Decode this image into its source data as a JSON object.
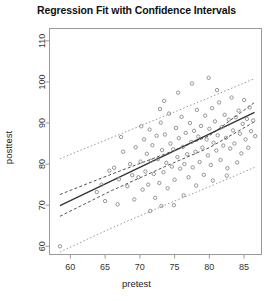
{
  "chart_data": {
    "type": "scatter",
    "title": "Regression Fit with Confidence Intervals",
    "xlabel": "pretest",
    "ylabel": "posttest",
    "xlim": [
      57.0,
      87.5
    ],
    "ylim": [
      58.0,
      113.0
    ],
    "xticks": [
      60,
      65,
      70,
      75,
      80,
      85
    ],
    "yticks": [
      60,
      70,
      80,
      90,
      100,
      110
    ],
    "grid": false,
    "legend": "none",
    "point_marker": "open-circle",
    "point_color": "#8a8a8a",
    "fit_line_color": "#333333",
    "ci_band_color": "#555555",
    "ci_band_style": "dashed",
    "pi_band_color": "#999999",
    "pi_band_style": "dotted",
    "fit_line": {
      "x": [
        58.5,
        86.5
      ],
      "y": [
        69.9,
        92.6
      ],
      "slope": 0.81,
      "intercept": 22.5
    },
    "confidence_band_upper": {
      "x": [
        58.5,
        66.0,
        74.0,
        80.0,
        86.5
      ],
      "y": [
        72.6,
        77.6,
        82.7,
        86.9,
        95.0
      ]
    },
    "confidence_band_lower": {
      "x": [
        58.5,
        66.0,
        74.0,
        80.0,
        86.5
      ],
      "y": [
        67.3,
        73.6,
        79.7,
        84.0,
        90.3
      ]
    },
    "prediction_band_upper": {
      "x": [
        58.5,
        66.0,
        74.0,
        80.0,
        86.5
      ],
      "y": [
        81.3,
        86.5,
        92.0,
        96.2,
        100.8
      ]
    },
    "prediction_band_lower": {
      "x": [
        58.5,
        66.0,
        74.0,
        80.0,
        86.5
      ],
      "y": [
        58.6,
        64.5,
        70.3,
        74.5,
        79.2
      ]
    },
    "points": [
      [
        58.5,
        60.0
      ],
      [
        66.3,
        79.1
      ],
      [
        67.0,
        76.3
      ],
      [
        67.6,
        83.0
      ],
      [
        68.2,
        74.6
      ],
      [
        68.6,
        80.0
      ],
      [
        68.9,
        77.3
      ],
      [
        69.2,
        71.4
      ],
      [
        69.4,
        84.1
      ],
      [
        69.8,
        76.8
      ],
      [
        70.1,
        80.6
      ],
      [
        70.4,
        73.8
      ],
      [
        70.6,
        86.0
      ],
      [
        70.8,
        78.2
      ],
      [
        71.0,
        82.5
      ],
      [
        71.2,
        75.0
      ],
      [
        71.4,
        88.4
      ],
      [
        71.6,
        80.8
      ],
      [
        71.8,
        84.6
      ],
      [
        72.0,
        77.6
      ],
      [
        72.2,
        71.8
      ],
      [
        72.4,
        86.9
      ],
      [
        72.6,
        81.2
      ],
      [
        72.8,
        75.4
      ],
      [
        73.0,
        90.1
      ],
      [
        73.2,
        83.4
      ],
      [
        73.4,
        78.0
      ],
      [
        73.6,
        87.2
      ],
      [
        73.8,
        80.3
      ],
      [
        74.0,
        74.1
      ],
      [
        74.2,
        92.3
      ],
      [
        74.4,
        85.0
      ],
      [
        74.6,
        79.4
      ],
      [
        74.8,
        83.6
      ],
      [
        75.0,
        76.2
      ],
      [
        75.2,
        88.8
      ],
      [
        75.4,
        81.7
      ],
      [
        75.6,
        86.3
      ],
      [
        75.8,
        78.9
      ],
      [
        76.0,
        91.5
      ],
      [
        76.2,
        84.2
      ],
      [
        76.4,
        80.0
      ],
      [
        76.6,
        87.6
      ],
      [
        76.8,
        82.4
      ],
      [
        77.0,
        76.8
      ],
      [
        77.2,
        90.0
      ],
      [
        77.4,
        85.4
      ],
      [
        77.6,
        79.2
      ],
      [
        77.8,
        88.1
      ],
      [
        78.0,
        83.0
      ],
      [
        78.2,
        93.2
      ],
      [
        78.4,
        86.7
      ],
      [
        78.6,
        80.5
      ],
      [
        78.8,
        89.3
      ],
      [
        79.0,
        84.0
      ],
      [
        79.2,
        77.4
      ],
      [
        79.4,
        91.8
      ],
      [
        79.6,
        86.0
      ],
      [
        79.8,
        82.1
      ],
      [
        80.0,
        88.6
      ],
      [
        80.2,
        79.8
      ],
      [
        80.4,
        93.6
      ],
      [
        80.6,
        85.2
      ],
      [
        80.8,
        90.4
      ],
      [
        81.0,
        83.3
      ],
      [
        81.2,
        87.0
      ],
      [
        81.4,
        95.0
      ],
      [
        81.6,
        81.0
      ],
      [
        81.8,
        89.0
      ],
      [
        82.0,
        84.5
      ],
      [
        82.2,
        92.0
      ],
      [
        82.4,
        86.4
      ],
      [
        82.6,
        79.0
      ],
      [
        82.8,
        90.8
      ],
      [
        83.0,
        83.8
      ],
      [
        83.2,
        96.2
      ],
      [
        83.4,
        88.2
      ],
      [
        83.6,
        85.0
      ],
      [
        83.8,
        91.4
      ],
      [
        84.0,
        80.4
      ],
      [
        84.2,
        93.0
      ],
      [
        84.4,
        87.4
      ],
      [
        84.6,
        82.6
      ],
      [
        84.8,
        89.8
      ],
      [
        85.0,
        95.6
      ],
      [
        85.2,
        86.0
      ],
      [
        85.4,
        91.0
      ],
      [
        85.6,
        84.0
      ],
      [
        85.8,
        93.8
      ],
      [
        86.0,
        88.0
      ],
      [
        86.3,
        90.6
      ],
      [
        86.6,
        86.8
      ],
      [
        64.5,
        75.0
      ],
      [
        65.0,
        71.0
      ],
      [
        65.6,
        78.4
      ],
      [
        66.8,
        70.2
      ],
      [
        63.8,
        73.2
      ],
      [
        67.3,
        86.6
      ],
      [
        73.5,
        95.4
      ],
      [
        75.5,
        97.4
      ],
      [
        77.5,
        99.6
      ],
      [
        79.9,
        101.0
      ],
      [
        81.1,
        98.0
      ],
      [
        72.9,
        93.4
      ],
      [
        70.2,
        89.2
      ],
      [
        74.9,
        70.0
      ],
      [
        76.3,
        72.4
      ],
      [
        78.1,
        74.8
      ],
      [
        80.5,
        76.0
      ],
      [
        82.5,
        77.2
      ],
      [
        71.5,
        68.6
      ],
      [
        73.1,
        69.8
      ]
    ]
  }
}
